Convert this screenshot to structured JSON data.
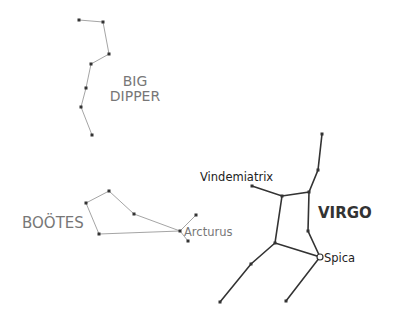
{
  "colors": {
    "faint_line": "#9a9a9a",
    "bold_line": "#333333",
    "faint_text": "#777777",
    "bold_text": "#333333",
    "star": "#333333"
  },
  "constellations": {
    "big_dipper": {
      "label_line1": "BIG",
      "label_line2": "DIPPER",
      "stars": [
        [
          79,
          20
        ],
        [
          103,
          22
        ],
        [
          109,
          54
        ],
        [
          91,
          64
        ],
        [
          86,
          88
        ],
        [
          81,
          107
        ],
        [
          92,
          135
        ]
      ]
    },
    "bootes": {
      "label": "BOÖTES",
      "stars": [
        [
          86,
          203
        ],
        [
          109,
          191
        ],
        [
          134,
          214
        ],
        [
          99,
          234
        ],
        [
          180,
          231
        ],
        [
          196,
          215
        ],
        [
          188,
          241
        ]
      ],
      "arcturus_label": "Arcturus"
    },
    "virgo": {
      "label": "VIRGO",
      "vindemiatrix_label": "Vindemiatrix",
      "spica_label": "Spica",
      "stars": [
        [
          322,
          134
        ],
        [
          318,
          170
        ],
        [
          309,
          192
        ],
        [
          282,
          196
        ],
        [
          252,
          186
        ],
        [
          308,
          231
        ],
        [
          320,
          257
        ],
        [
          275,
          243
        ],
        [
          251,
          264
        ],
        [
          220,
          302
        ],
        [
          286,
          301
        ]
      ]
    }
  }
}
